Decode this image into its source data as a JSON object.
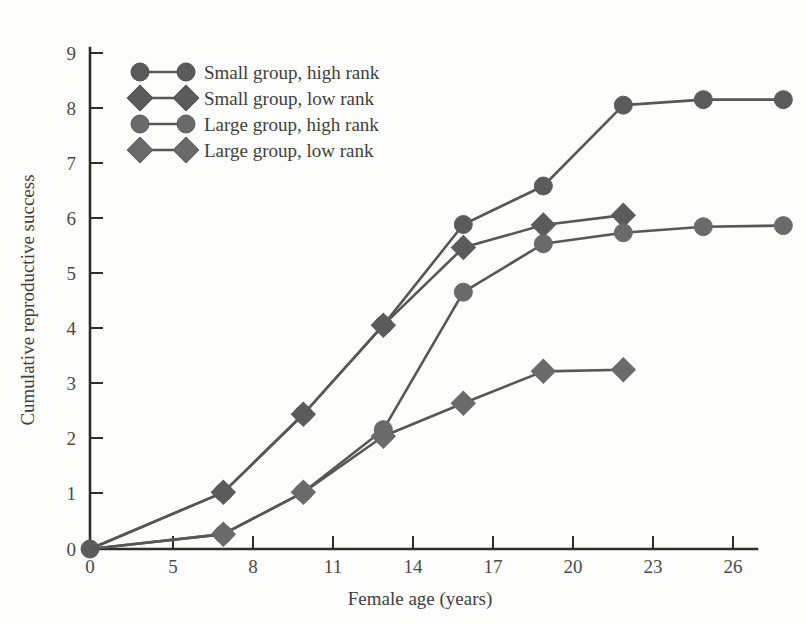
{
  "figure": {
    "background_color": "#fdfdfb",
    "ink_color": "#575757",
    "axis_color": "#2e2e2e"
  },
  "chart_data": {
    "type": "line",
    "title": "",
    "xlabel": "Female age (years)",
    "ylabel": "Cumulative reproductive success",
    "xlim": [
      0,
      27
    ],
    "ylim": [
      0,
      9
    ],
    "xticks": [
      0,
      5,
      8,
      11,
      14,
      17,
      20,
      23,
      26
    ],
    "xtick_labels": [
      "0",
      "5",
      "8",
      "11",
      "14",
      "17",
      "20",
      "23",
      "26"
    ],
    "yticks": [
      0,
      1,
      2,
      3,
      4,
      5,
      6,
      7,
      8,
      9
    ],
    "ytick_labels": [
      "0",
      "1",
      "2",
      "3",
      "4",
      "5",
      "6",
      "7",
      "8",
      "9"
    ],
    "grid": false,
    "legend_position": "top-left",
    "series": [
      {
        "name": "Small group, high rank",
        "marker": "circle",
        "color": "#5b5b5b",
        "x": [
          0,
          5,
          8,
          11,
          14,
          17,
          20,
          23,
          26
        ],
        "values": [
          0,
          1.03,
          2.45,
          4.07,
          5.9,
          6.6,
          8.07,
          8.17,
          8.17
        ]
      },
      {
        "name": "Small group, low rank",
        "marker": "diamond",
        "color": "#5b5b5b",
        "x": [
          0,
          5,
          8,
          11,
          14,
          17,
          20
        ],
        "values": [
          0,
          1.03,
          2.45,
          4.07,
          5.48,
          5.89,
          6.07
        ]
      },
      {
        "name": "Large group, high rank",
        "marker": "circle",
        "color": "#6a6a6a",
        "x": [
          0,
          5,
          8,
          11,
          14,
          17,
          20,
          23,
          26
        ],
        "values": [
          0,
          0.27,
          1.03,
          2.17,
          4.67,
          5.55,
          5.75,
          5.86,
          5.88
        ]
      },
      {
        "name": "Large group, low rank",
        "marker": "diamond",
        "color": "#6a6a6a",
        "x": [
          0,
          5,
          8,
          11,
          14,
          17,
          20
        ],
        "values": [
          0,
          0.27,
          1.03,
          2.05,
          2.65,
          3.23,
          3.26
        ]
      }
    ],
    "legend": [
      {
        "label": "Small group, high rank",
        "marker": "circle",
        "shade": "dark"
      },
      {
        "label": "Small group, low rank",
        "marker": "diamond",
        "shade": "dark"
      },
      {
        "label": "Large group, high rank",
        "marker": "circle",
        "shade": "light"
      },
      {
        "label": "Large group, low rank",
        "marker": "diamond",
        "shade": "light"
      }
    ]
  }
}
